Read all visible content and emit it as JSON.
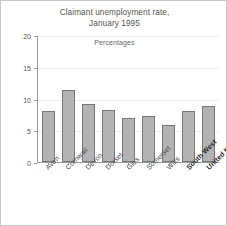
{
  "chart_data": {
    "type": "bar",
    "title": "Claimant unemployment rate, January 1995",
    "title_lines": [
      "Claimant unemployment rate,",
      "January 1995"
    ],
    "subtitle": "Percentages",
    "xlabel": "",
    "ylabel": "",
    "ylim": [
      0,
      20
    ],
    "yticks": [
      0,
      5,
      10,
      15,
      20
    ],
    "ytick_labels": [
      "0",
      "5",
      "10",
      "15",
      "20"
    ],
    "grid": true,
    "legend": false,
    "categories": [
      "Avon",
      "Cornwall",
      "Devon",
      "Dorset",
      "Glos",
      "Somerset",
      "Wilts",
      "South West",
      "United Kingdom"
    ],
    "emphasized_categories": [
      "South West",
      "United Kingdom"
    ],
    "values": [
      8.0,
      11.3,
      9.1,
      8.2,
      7.0,
      7.3,
      5.8,
      8.1,
      8.9
    ],
    "bar_color": "#b3b3b3",
    "bar_edge_color": "#777777",
    "axis_color": "#9a9a9a",
    "grid_color": "#ededed",
    "text_color": "#555555",
    "background": "#ffffff"
  }
}
